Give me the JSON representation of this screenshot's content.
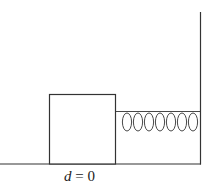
{
  "diagram": {
    "type": "mass-spring system",
    "label": {
      "variable": "d",
      "equals": " = ",
      "value": "0"
    },
    "elements": [
      "floor",
      "wall",
      "block",
      "spring"
    ],
    "spring_coils": 7,
    "colors": {
      "stroke": "#333333",
      "background": "#ffffff"
    }
  }
}
